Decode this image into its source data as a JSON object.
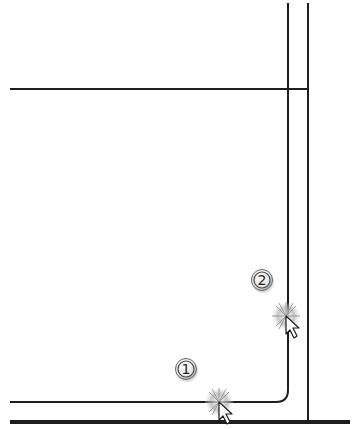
{
  "diagram": {
    "type": "cad-snap-steps",
    "colors": {
      "line": "#1e1e1e",
      "background": "#ffffff",
      "snap_glow": "#9a9a9a",
      "cursor_fill": "#ffffff",
      "badge_fill": "#f2f2f2"
    },
    "steps": [
      {
        "number": "1",
        "label": "step-1"
      },
      {
        "number": "2",
        "label": "step-2"
      }
    ]
  }
}
